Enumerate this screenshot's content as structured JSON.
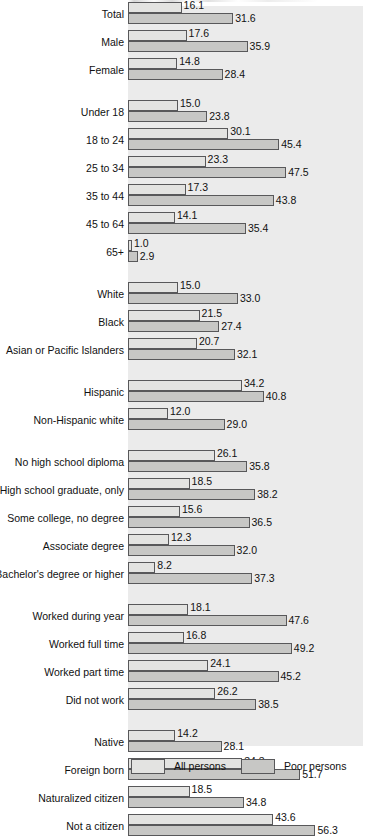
{
  "chart_data": {
    "type": "bar",
    "title": "",
    "xlabel": "",
    "ylabel": "",
    "orientation": "horizontal",
    "grid": false,
    "xlim": [
      0,
      60
    ],
    "legend_position": "bottom",
    "series": [
      {
        "name": "All persons",
        "color": "#e3e3e1",
        "values": [
          16.1,
          17.6,
          14.8,
          15.0,
          30.1,
          23.3,
          17.3,
          14.1,
          1.0,
          15.0,
          21.5,
          20.7,
          34.2,
          12.0,
          26.1,
          18.5,
          15.6,
          12.3,
          8.2,
          18.1,
          16.8,
          24.1,
          26.2,
          14.2,
          34.3,
          18.5,
          43.6
        ]
      },
      {
        "name": "Poor persons",
        "color": "#c7c7c5",
        "values": [
          31.6,
          35.9,
          28.4,
          23.8,
          45.4,
          47.5,
          43.8,
          35.4,
          2.9,
          33.0,
          27.4,
          32.1,
          40.8,
          29.0,
          35.8,
          38.2,
          36.5,
          32.0,
          37.3,
          47.6,
          49.2,
          45.2,
          38.5,
          28.1,
          51.7,
          34.8,
          56.3
        ]
      }
    ],
    "categories": [
      "Total",
      "Male",
      "Female",
      "Under 18",
      "18 to 24",
      "25 to 34",
      "35 to 44",
      "45 to 64",
      "65+",
      "White",
      "Black",
      "Asian or Pacific Islanders",
      "Hispanic",
      "Non-Hispanic white",
      "No high school diploma",
      "High school graduate, only",
      "Some college, no degree",
      "Associate degree",
      "Bachelor's degree or higher",
      "Worked during year",
      "Worked full time",
      "Worked part time",
      "Did not work",
      "Native",
      "Foreign born",
      "Naturalized citizen",
      "Not a citizen"
    ],
    "groups": [
      {
        "name": "overall-and-sex",
        "rows": [
          {
            "label": "Total",
            "all": "16.1",
            "poor": "31.6"
          },
          {
            "label": "Male",
            "all": "17.6",
            "poor": "35.9"
          },
          {
            "label": "Female",
            "all": "14.8",
            "poor": "28.4"
          }
        ]
      },
      {
        "name": "age",
        "rows": [
          {
            "label": "Under 18",
            "all": "15.0",
            "poor": "23.8"
          },
          {
            "label": "18 to 24",
            "all": "30.1",
            "poor": "45.4"
          },
          {
            "label": "25 to 34",
            "all": "23.3",
            "poor": "47.5"
          },
          {
            "label": "35 to 44",
            "all": "17.3",
            "poor": "43.8"
          },
          {
            "label": "45 to 64",
            "all": "14.1",
            "poor": "35.4"
          },
          {
            "label": "65+",
            "all": "1.0",
            "poor": "2.9"
          }
        ]
      },
      {
        "name": "race",
        "rows": [
          {
            "label": "White",
            "all": "15.0",
            "poor": "33.0"
          },
          {
            "label": "Black",
            "all": "21.5",
            "poor": "27.4"
          },
          {
            "label": "Asian or Pacific Islanders",
            "all": "20.7",
            "poor": "32.1"
          }
        ]
      },
      {
        "name": "ethnicity",
        "rows": [
          {
            "label": "Hispanic",
            "all": "34.2",
            "poor": "40.8"
          },
          {
            "label": "Non-Hispanic white",
            "all": "12.0",
            "poor": "29.0"
          }
        ]
      },
      {
        "name": "education",
        "rows": [
          {
            "label": "No high school diploma",
            "all": "26.1",
            "poor": "35.8"
          },
          {
            "label": "High school graduate, only",
            "all": "18.5",
            "poor": "38.2"
          },
          {
            "label": "Some college, no degree",
            "all": "15.6",
            "poor": "36.5"
          },
          {
            "label": "Associate degree",
            "all": "12.3",
            "poor": "32.0"
          },
          {
            "label": "Bachelor's degree or higher",
            "all": "8.2",
            "poor": "37.3"
          }
        ]
      },
      {
        "name": "work-status",
        "rows": [
          {
            "label": "Worked during year",
            "all": "18.1",
            "poor": "47.6"
          },
          {
            "label": "Worked full time",
            "all": "16.8",
            "poor": "49.2"
          },
          {
            "label": "Worked part time",
            "all": "24.1",
            "poor": "45.2"
          },
          {
            "label": "Did not work",
            "all": "26.2",
            "poor": "38.5"
          }
        ]
      },
      {
        "name": "nativity",
        "rows": [
          {
            "label": "Native",
            "all": "14.2",
            "poor": "28.1"
          },
          {
            "label": "Foreign born",
            "all": "34.3",
            "poor": "51.7"
          },
          {
            "label": "Naturalized citizen",
            "all": "18.5",
            "poor": "34.8"
          },
          {
            "label": "Not a citizen",
            "all": "43.6",
            "poor": "56.3"
          }
        ]
      }
    ],
    "legend": [
      {
        "label": "All persons",
        "color": "#e3e3e1"
      },
      {
        "label": "Poor persons",
        "color": "#c7c7c5"
      }
    ]
  }
}
